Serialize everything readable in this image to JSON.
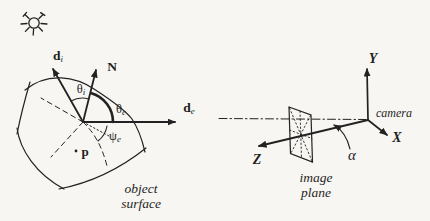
{
  "figure": {
    "background_color": "#f7f6f2",
    "ink_color": "#222222"
  },
  "left_diagram": {
    "icons": {
      "sun": "sun-icon"
    },
    "vectors": {
      "incident": {
        "main": "d",
        "sub": "i"
      },
      "normal": {
        "main": "N"
      },
      "emittance": {
        "main": "d",
        "sub": "e"
      }
    },
    "angles": {
      "theta_i": {
        "main": "θ",
        "sub": "i"
      },
      "theta_e": {
        "main": "θ",
        "sub": "e"
      },
      "psi_e": {
        "main": "ψ",
        "sub": "e"
      }
    },
    "point_label": "p",
    "caption": {
      "line1": "object",
      "line2": "surface"
    }
  },
  "right_diagram": {
    "axes": {
      "x": "X",
      "y": "Y",
      "z": "Z"
    },
    "camera_label": "camera",
    "angle_alpha": "α",
    "caption": {
      "line1": "image",
      "line2": "plane"
    }
  }
}
